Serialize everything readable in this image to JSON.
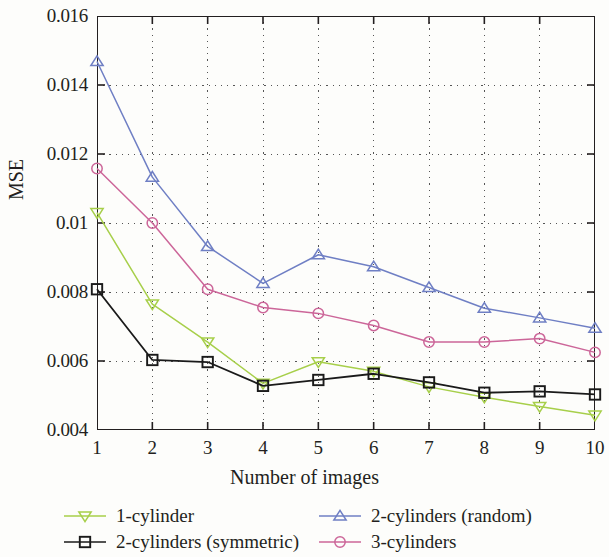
{
  "chart_data": {
    "type": "line",
    "title": "",
    "xlabel": "Number of images",
    "ylabel": "MSE",
    "x": [
      1,
      2,
      3,
      4,
      5,
      6,
      7,
      8,
      9,
      10
    ],
    "xticklabels": [
      "1",
      "2",
      "3",
      "4",
      "5",
      "6",
      "7",
      "8",
      "9",
      "10"
    ],
    "yticklabels": [
      "0.004",
      "0.006",
      "0.008",
      "0.01",
      "0.012",
      "0.014",
      "0.016"
    ],
    "ytickvalues": [
      0.004,
      0.006,
      0.008,
      0.01,
      0.012,
      0.014,
      0.016
    ],
    "xlim": [
      1,
      10
    ],
    "ylim": [
      0.004,
      0.016
    ],
    "grid": "dotted",
    "legend_position": "below",
    "series": [
      {
        "name": "1-cylinder",
        "color": "#a7cf4a",
        "marker": "triangle-down",
        "values": [
          0.0103,
          0.00765,
          0.00655,
          0.00535,
          0.00598,
          0.0057,
          0.00525,
          0.00495,
          0.00468,
          0.00443
        ]
      },
      {
        "name": "2-cylinders (symmetric)",
        "color": "#1a1a1a",
        "marker": "square",
        "values": [
          0.00808,
          0.00603,
          0.00597,
          0.00528,
          0.00545,
          0.00563,
          0.00538,
          0.00508,
          0.00512,
          0.00503
        ]
      },
      {
        "name": "2-cylinders (random)",
        "color": "#6f7fc4",
        "marker": "triangle-up",
        "values": [
          0.01468,
          0.01133,
          0.00932,
          0.00825,
          0.00908,
          0.00873,
          0.00813,
          0.00753,
          0.00725,
          0.00695
        ]
      },
      {
        "name": "3-cylinders",
        "color": "#cc6699",
        "marker": "circle",
        "values": [
          0.01158,
          0.01,
          0.00808,
          0.00755,
          0.00738,
          0.00703,
          0.00655,
          0.00655,
          0.00665,
          0.00625
        ]
      }
    ]
  },
  "legend": {
    "entries": [
      {
        "label": "1-cylinder"
      },
      {
        "label": "2-cylinders (random)"
      },
      {
        "label": "2-cylinders (symmetric)"
      },
      {
        "label": "3-cylinders"
      }
    ]
  },
  "axes": {
    "y_title": "MSE",
    "x_title": "Number of images"
  }
}
